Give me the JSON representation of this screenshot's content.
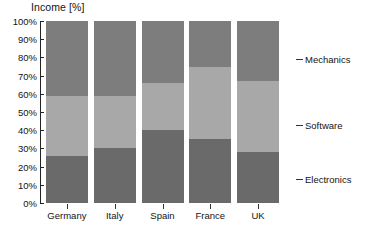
{
  "chart_data": {
    "type": "bar",
    "subtype": "stacked-bar-100-percent",
    "title": "Income [%]",
    "xlabel": "",
    "ylabel": "Income [%]",
    "ylim": [
      0,
      100
    ],
    "ytick_labels": [
      "100%",
      "90%",
      "80%",
      "70%",
      "60%",
      "50%",
      "40%",
      "30%",
      "20%",
      "10%",
      "0%"
    ],
    "ytick_values": [
      100,
      90,
      80,
      70,
      60,
      50,
      40,
      30,
      20,
      10,
      0
    ],
    "grid": false,
    "legend_position": "right-callout",
    "categories": [
      "Germany",
      "Italy",
      "Spain",
      "France",
      "UK"
    ],
    "series": [
      {
        "name": "Electronics",
        "color": "#6a6a6a",
        "values": [
          26,
          30,
          40,
          35,
          28
        ]
      },
      {
        "name": "Software",
        "color": "#a8a8a8",
        "values": [
          33,
          29,
          26,
          40,
          39
        ]
      },
      {
        "name": "Mechanics",
        "color": "#7d7d7d",
        "values": [
          41,
          41,
          34,
          25,
          33
        ]
      }
    ],
    "cumulative_tops": {
      "Electronics": [
        26,
        30,
        40,
        35,
        28
      ],
      "Software": [
        59,
        59,
        66,
        75,
        67
      ],
      "Mechanics": [
        100,
        100,
        100,
        100,
        100
      ]
    },
    "legend_callouts": [
      {
        "label": "Mechanics",
        "y_percent": 79
      },
      {
        "label": "Software",
        "y_percent": 43
      },
      {
        "label": "Electronics",
        "y_percent": 13
      }
    ]
  },
  "colors": {
    "mechanics": "#7d7d7d",
    "software": "#a8a8a8",
    "electronics": "#6a6a6a",
    "axis": "#222222",
    "text": "#141414",
    "background": "#ffffff"
  }
}
